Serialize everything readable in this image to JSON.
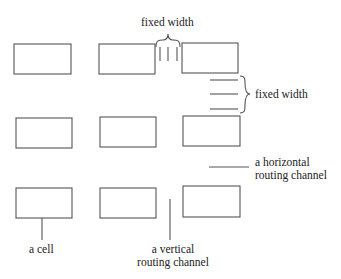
{
  "diagram": {
    "type": "gate-array layout",
    "stroke_color": "#555555",
    "cells": [
      {
        "id": "r1c1",
        "x": 14,
        "y": 44,
        "w": 57,
        "h": 30
      },
      {
        "id": "r1c2",
        "x": 99,
        "y": 44,
        "w": 56,
        "h": 30
      },
      {
        "id": "r1c3",
        "x": 182,
        "y": 43,
        "w": 56,
        "h": 30
      },
      {
        "id": "r2c1",
        "x": 16,
        "y": 118,
        "w": 56,
        "h": 30
      },
      {
        "id": "r2c2",
        "x": 100,
        "y": 117,
        "w": 56,
        "h": 30
      },
      {
        "id": "r2c3",
        "x": 183,
        "y": 116,
        "w": 57,
        "h": 30
      },
      {
        "id": "r3c1",
        "x": 16,
        "y": 188,
        "w": 56,
        "h": 30
      },
      {
        "id": "r3c2",
        "x": 100,
        "y": 188,
        "w": 56,
        "h": 30
      },
      {
        "id": "r3c3",
        "x": 183,
        "y": 186,
        "w": 57,
        "h": 31
      }
    ],
    "labels": {
      "fixed_width_top": "fixed width",
      "fixed_width_right": "fixed width",
      "horizontal_channel_line1": "a horizontal",
      "horizontal_channel_line2": "routing channel",
      "cell": "a cell",
      "vertical_channel_line1": "a vertical",
      "vertical_channel_line2": "routing channel"
    }
  }
}
